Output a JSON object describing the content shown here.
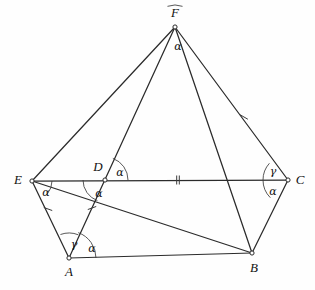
{
  "figure": {
    "background_color": "#fefefe",
    "line_color": "#2b2b2b",
    "arc_color": "#3a3a3a"
  },
  "vertices": [
    {
      "id": "F",
      "label": "F",
      "x": 175,
      "y": 27,
      "label_x": 175,
      "label_y": 14
    },
    {
      "id": "E",
      "label": "E",
      "x": 32,
      "y": 181,
      "label_x": 18,
      "label_y": 181
    },
    {
      "id": "D",
      "label": "D",
      "x": 105,
      "y": 180,
      "label_x": 98,
      "label_y": 168
    },
    {
      "id": "C",
      "label": "C",
      "x": 288,
      "y": 180,
      "label_x": 300,
      "label_y": 181
    },
    {
      "id": "A",
      "label": "A",
      "x": 69,
      "y": 258,
      "label_x": 69,
      "label_y": 273
    },
    {
      "id": "B",
      "label": "B",
      "x": 252,
      "y": 253,
      "label_x": 254,
      "label_y": 269
    }
  ],
  "segments": [
    {
      "name": "segment-E-C",
      "from": "E",
      "to": "C"
    },
    {
      "name": "segment-E-F",
      "from": "E",
      "to": "F"
    },
    {
      "name": "segment-F-C",
      "from": "F",
      "to": "C"
    },
    {
      "name": "segment-F-A",
      "from": "F",
      "to": "A"
    },
    {
      "name": "segment-F-B",
      "from": "F",
      "to": "B"
    },
    {
      "name": "segment-E-B",
      "from": "E",
      "to": "B"
    },
    {
      "name": "segment-E-A",
      "from": "E",
      "to": "A"
    },
    {
      "name": "segment-A-B",
      "from": "A",
      "to": "B"
    },
    {
      "name": "segment-B-C",
      "from": "B",
      "to": "C"
    }
  ],
  "angle_marks": [
    {
      "name": "angle-F-alpha",
      "symbol": "α",
      "vertex": "F",
      "label_x": 178,
      "label_y": 47,
      "arc_radius": 22,
      "start_deg": 250,
      "end_deg": 290
    },
    {
      "name": "angle-D-upper-alpha",
      "symbol": "α",
      "vertex": "D",
      "label_x": 120,
      "label_y": 173,
      "arc_radius": 23,
      "start_deg": 290,
      "end_deg": 360
    },
    {
      "name": "angle-D-lower-alpha",
      "symbol": "α",
      "vertex": "D",
      "label_x": 99,
      "label_y": 194,
      "arc_radius": 22,
      "start_deg": 110,
      "end_deg": 180
    },
    {
      "name": "angle-E-alpha",
      "symbol": "α",
      "vertex": "E",
      "label_x": 46,
      "label_y": 193,
      "arc_radius": 20,
      "start_deg": 0,
      "end_deg": 40
    },
    {
      "name": "angle-A-gamma",
      "symbol": "γ",
      "vertex": "A",
      "label_x": 74,
      "label_y": 245,
      "arc_radius": 25,
      "start_deg": 250,
      "end_deg": 292
    },
    {
      "name": "angle-A-alpha",
      "symbol": "α",
      "vertex": "A",
      "label_x": 92,
      "label_y": 249,
      "arc_radius": 27,
      "start_deg": 290,
      "end_deg": 360
    },
    {
      "name": "angle-C-gamma",
      "symbol": "γ",
      "vertex": "C",
      "label_x": 273,
      "label_y": 172,
      "arc_radius": 25,
      "start_deg": 180,
      "end_deg": 222
    },
    {
      "name": "angle-C-alpha",
      "symbol": "α",
      "vertex": "C",
      "label_x": 273,
      "label_y": 192,
      "arc_radius": 25,
      "start_deg": 135,
      "end_deg": 180
    }
  ],
  "tick_marks": [
    {
      "name": "tick-DC-double",
      "segment": "segment-D-C",
      "x": 178,
      "y": 180,
      "count": 2,
      "angle_deg": 90
    },
    {
      "name": "tick-FC-single",
      "segment": "segment-F-C",
      "x": 244,
      "y": 117,
      "count": 1,
      "angle_deg": 30
    },
    {
      "name": "tick-EA-single",
      "segment": "segment-E-A",
      "x": 48,
      "y": 209,
      "count": 1,
      "angle_deg": 20
    },
    {
      "name": "tick-DA-single",
      "segment": "segment-D-A",
      "x": 92,
      "y": 208,
      "count": 1,
      "angle_deg": 160
    }
  ],
  "legend": {
    "alpha_symbol": "α",
    "gamma_symbol": "γ"
  }
}
